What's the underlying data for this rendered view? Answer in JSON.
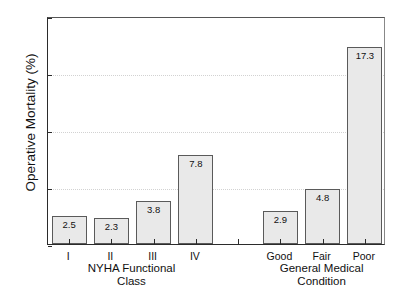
{
  "chart_data": {
    "type": "bar",
    "title": "",
    "xlabel": "",
    "ylabel": "Operative Mortality (%)",
    "ylim": [
      0,
      20
    ],
    "yticks": [
      0,
      5,
      10,
      15,
      20
    ],
    "ytick_labels": [
      "0",
      "5",
      "10",
      "15",
      "20"
    ],
    "grid": "horizontal-dotted",
    "legend": "none",
    "categories": [
      "I",
      "II",
      "III",
      "IV",
      "Good",
      "Fair",
      "Poor"
    ],
    "values": [
      2.5,
      2.3,
      3.8,
      7.8,
      2.9,
      4.8,
      17.3
    ],
    "value_labels": [
      "2.5",
      "2.3",
      "3.8",
      "7.8",
      "2.9",
      "4.8",
      "17.3"
    ],
    "groups": [
      {
        "title": "NYHA Functional\nClass",
        "title_line1": "NYHA Functional",
        "title_line2": "Class",
        "categories": [
          "I",
          "II",
          "III",
          "IV"
        ],
        "values": [
          2.5,
          2.3,
          3.8,
          7.8
        ]
      },
      {
        "title": "General Medical\nCondition",
        "title_line1": "General Medical",
        "title_line2": "Condition",
        "categories": [
          "Good",
          "Fair",
          "Poor"
        ],
        "values": [
          2.9,
          4.8,
          17.3
        ]
      }
    ],
    "bar_color": "#e9e9e9",
    "bar_edge_color": "#5a5a5a",
    "gridline_color": "#d2d2d2",
    "axis_color": "#2b2b2b"
  },
  "axis": {
    "y_title": "Operative Mortality (%)"
  },
  "group_labels": {
    "left_line1": "NYHA Functional",
    "left_line2": "Class",
    "right_line1": "General Medical",
    "right_line2": "Condition"
  }
}
